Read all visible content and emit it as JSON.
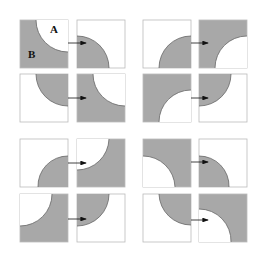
{
  "diagram": {
    "labels": {
      "a": "A",
      "b": "B"
    },
    "colors": {
      "fill": "#a8a8a8",
      "stroke": "#666666",
      "box": "#bbbbbb",
      "arrow": "#111111"
    },
    "groups": [
      {
        "name": "group-top-left"
      },
      {
        "name": "group-top-right"
      },
      {
        "name": "group-bottom-left"
      },
      {
        "name": "group-bottom-right"
      }
    ]
  }
}
